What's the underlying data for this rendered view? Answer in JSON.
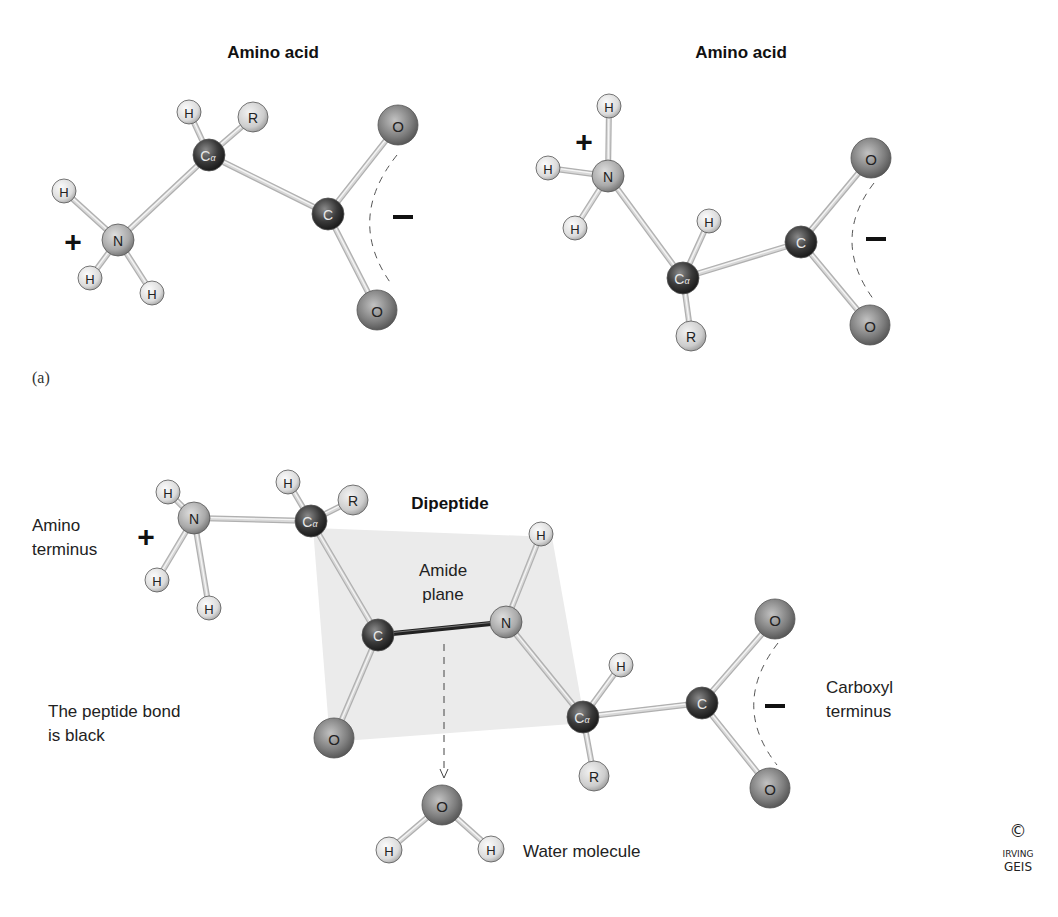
{
  "panel_label": "(a)",
  "colors": {
    "background": "#ffffff",
    "amide_plane": "#ebebeb",
    "bond": "#d8d8d8",
    "bond_edge": "#b0b0b0",
    "peptide_bond": "#222222",
    "hydrogen": "#e2e2e2",
    "nitrogen": "#a8a8a8",
    "carbon": "#3a3a3a",
    "oxygen": "#7a7a7a",
    "r_group": "#d2d2d2"
  },
  "molecules": [
    {
      "id": "amino-acid-1",
      "title": "Amino acid",
      "title_pos": [
        273,
        52
      ],
      "atoms": [
        {
          "id": "N",
          "label": "N",
          "el": "N",
          "x": 118,
          "y": 240,
          "r": 16
        },
        {
          "id": "H1",
          "label": "H",
          "el": "H",
          "x": 64,
          "y": 191,
          "r": 12
        },
        {
          "id": "H2",
          "label": "H",
          "el": "H",
          "x": 90,
          "y": 278,
          "r": 12
        },
        {
          "id": "H3",
          "label": "H",
          "el": "H",
          "x": 152,
          "y": 293,
          "r": 12
        },
        {
          "id": "CA",
          "label": "Cα",
          "el": "C",
          "x": 209,
          "y": 155,
          "r": 16
        },
        {
          "id": "HA",
          "label": "H",
          "el": "H",
          "x": 189,
          "y": 112,
          "r": 12
        },
        {
          "id": "R",
          "label": "R",
          "el": "R",
          "x": 253,
          "y": 117,
          "r": 15
        },
        {
          "id": "C",
          "label": "C",
          "el": "C",
          "x": 328,
          "y": 214,
          "r": 16
        },
        {
          "id": "O1",
          "label": "O",
          "el": "O",
          "x": 398,
          "y": 125,
          "r": 20
        },
        {
          "id": "O2",
          "label": "O",
          "el": "O",
          "x": 377,
          "y": 310,
          "r": 20
        }
      ],
      "bonds": [
        [
          "N",
          "H1"
        ],
        [
          "N",
          "H2"
        ],
        [
          "N",
          "H3"
        ],
        [
          "N",
          "CA"
        ],
        [
          "CA",
          "HA"
        ],
        [
          "CA",
          "R"
        ],
        [
          "CA",
          "C"
        ],
        [
          "C",
          "O1"
        ],
        [
          "C",
          "O2"
        ]
      ],
      "plus": {
        "x": 73,
        "y": 241,
        "size": 30
      },
      "minus": {
        "x": 403,
        "y": 217,
        "size": 30
      },
      "arc": {
        "d": "M 397 155 Q 345 220 392 285"
      }
    },
    {
      "id": "amino-acid-2",
      "title": "Amino acid",
      "title_pos": [
        741,
        52
      ],
      "atoms": [
        {
          "id": "N",
          "label": "N",
          "el": "N",
          "x": 608,
          "y": 176,
          "r": 16
        },
        {
          "id": "H1",
          "label": "H",
          "el": "H",
          "x": 609,
          "y": 106,
          "r": 12
        },
        {
          "id": "H2",
          "label": "H",
          "el": "H",
          "x": 548,
          "y": 168,
          "r": 12
        },
        {
          "id": "H3",
          "label": "H",
          "el": "H",
          "x": 575,
          "y": 228,
          "r": 12
        },
        {
          "id": "CA",
          "label": "Cα",
          "el": "C",
          "x": 683,
          "y": 278,
          "r": 16
        },
        {
          "id": "HA",
          "label": "H",
          "el": "H",
          "x": 709,
          "y": 221,
          "r": 12
        },
        {
          "id": "R",
          "label": "R",
          "el": "R",
          "x": 691,
          "y": 336,
          "r": 15
        },
        {
          "id": "C",
          "label": "C",
          "el": "C",
          "x": 801,
          "y": 242,
          "r": 16
        },
        {
          "id": "O1",
          "label": "O",
          "el": "O",
          "x": 871,
          "y": 158,
          "r": 20
        },
        {
          "id": "O2",
          "label": "O",
          "el": "O",
          "x": 870,
          "y": 325,
          "r": 20
        }
      ],
      "bonds": [
        [
          "N",
          "H1"
        ],
        [
          "N",
          "H2"
        ],
        [
          "N",
          "H3"
        ],
        [
          "N",
          "CA"
        ],
        [
          "CA",
          "HA"
        ],
        [
          "CA",
          "R"
        ],
        [
          "CA",
          "C"
        ],
        [
          "C",
          "O1"
        ],
        [
          "C",
          "O2"
        ]
      ],
      "plus": {
        "x": 584,
        "y": 141,
        "size": 30
      },
      "minus": {
        "x": 876,
        "y": 239,
        "size": 30
      },
      "arc": {
        "d": "M 874 183 Q 830 240 874 300"
      }
    },
    {
      "id": "dipeptide",
      "title": "Dipeptide",
      "title_pos": [
        450,
        503
      ],
      "atoms": [
        {
          "id": "N1",
          "label": "N",
          "el": "N",
          "x": 194,
          "y": 518,
          "r": 16
        },
        {
          "id": "H1",
          "label": "H",
          "el": "H",
          "x": 168,
          "y": 492,
          "r": 12
        },
        {
          "id": "H2",
          "label": "H",
          "el": "H",
          "x": 157,
          "y": 580,
          "r": 12
        },
        {
          "id": "H3",
          "label": "H",
          "el": "H",
          "x": 209,
          "y": 608,
          "r": 12
        },
        {
          "id": "CA1",
          "label": "Cα",
          "el": "C",
          "x": 311,
          "y": 521,
          "r": 16
        },
        {
          "id": "HA1",
          "label": "H",
          "el": "H",
          "x": 288,
          "y": 482,
          "r": 12
        },
        {
          "id": "R1",
          "label": "R",
          "el": "R",
          "x": 353,
          "y": 500,
          "r": 15
        },
        {
          "id": "C1",
          "label": "C",
          "el": "C",
          "x": 378,
          "y": 635,
          "r": 16
        },
        {
          "id": "O1",
          "label": "O",
          "el": "O",
          "x": 334,
          "y": 738,
          "r": 20
        },
        {
          "id": "N2",
          "label": "N",
          "el": "N",
          "x": 506,
          "y": 622,
          "r": 16
        },
        {
          "id": "HN2",
          "label": "H",
          "el": "H",
          "x": 541,
          "y": 534,
          "r": 12
        },
        {
          "id": "CA2",
          "label": "Cα",
          "el": "C",
          "x": 583,
          "y": 717,
          "r": 16
        },
        {
          "id": "HA2",
          "label": "H",
          "el": "H",
          "x": 621,
          "y": 665,
          "r": 12
        },
        {
          "id": "R2",
          "label": "R",
          "el": "R",
          "x": 594,
          "y": 776,
          "r": 15
        },
        {
          "id": "C2",
          "label": "C",
          "el": "C",
          "x": 702,
          "y": 703,
          "r": 16
        },
        {
          "id": "O2",
          "label": "O",
          "el": "O",
          "x": 775,
          "y": 619,
          "r": 20
        },
        {
          "id": "O3",
          "label": "O",
          "el": "O",
          "x": 770,
          "y": 788,
          "r": 20
        }
      ],
      "bonds": [
        [
          "N1",
          "H1"
        ],
        [
          "N1",
          "H2"
        ],
        [
          "N1",
          "H3"
        ],
        [
          "N1",
          "CA1"
        ],
        [
          "CA1",
          "HA1"
        ],
        [
          "CA1",
          "R1"
        ],
        [
          "CA1",
          "C1"
        ],
        [
          "C1",
          "O1"
        ],
        [
          "N2",
          "HN2"
        ],
        [
          "N2",
          "CA2"
        ],
        [
          "CA2",
          "HA2"
        ],
        [
          "CA2",
          "R2"
        ],
        [
          "CA2",
          "C2"
        ],
        [
          "C2",
          "O2"
        ],
        [
          "C2",
          "O3"
        ]
      ],
      "peptide_bond": [
        "C1",
        "N2"
      ],
      "plus": {
        "x": 146,
        "y": 536,
        "size": 30
      },
      "minus": {
        "x": 775,
        "y": 706,
        "size": 30
      },
      "arc": {
        "d": "M 778 643 Q 730 705 777 765"
      },
      "amide_plane": "313,528 552,537 585,723 330,742"
    },
    {
      "id": "water",
      "title": "",
      "atoms": [
        {
          "id": "O",
          "label": "O",
          "el": "O",
          "x": 442,
          "y": 805,
          "r": 20
        },
        {
          "id": "H1",
          "label": "H",
          "el": "H",
          "x": 389,
          "y": 850,
          "r": 13
        },
        {
          "id": "H2",
          "label": "H",
          "el": "H",
          "x": 491,
          "y": 849,
          "r": 13
        }
      ],
      "bonds": [
        [
          "O",
          "H1"
        ],
        [
          "O",
          "H2"
        ]
      ]
    }
  ],
  "annotations": {
    "amino_terminus": [
      "Amino",
      "terminus"
    ],
    "amide_plane": [
      "Amide",
      "plane"
    ],
    "carboxyl_terminus": [
      "Carboxyl",
      "terminus"
    ],
    "peptide_bond_note": [
      "The peptide bond",
      "is black"
    ],
    "water_molecule": "Water molecule"
  },
  "water_arrow": {
    "x": 444,
    "y1": 644,
    "y2": 778
  },
  "signature": {
    "copyright": "©",
    "line1": "IRVING",
    "line2": "GEIS"
  }
}
